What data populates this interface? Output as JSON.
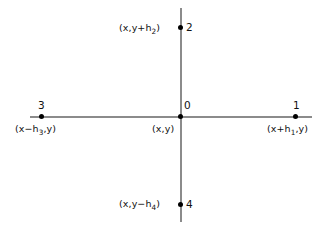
{
  "diagram": {
    "background_color": "#ffffff",
    "axis_color": "#8b8b8b",
    "node_color": "#000000",
    "text_color": "#111111",
    "nodes": [
      {
        "id": "0",
        "number": "0",
        "coordinate_plain": "(x,y)",
        "coord_prefix": "(x,y",
        "coord_sub": "",
        "coord_suffix": ")",
        "position": "center"
      },
      {
        "id": "1",
        "number": "1",
        "coordinate_plain": "(x+h1,y)",
        "coord_prefix": "(x+h",
        "coord_sub": "1",
        "coord_suffix": ",y)",
        "position": "right"
      },
      {
        "id": "2",
        "number": "2",
        "coordinate_plain": "(x,y+h2)",
        "coord_prefix": "(x,y+h",
        "coord_sub": "2",
        "coord_suffix": ")",
        "position": "top"
      },
      {
        "id": "3",
        "number": "3",
        "coordinate_plain": "(x−h3,y)",
        "coord_prefix": "(x−h",
        "coord_sub": "3",
        "coord_suffix": ",y)",
        "position": "left"
      },
      {
        "id": "4",
        "number": "4",
        "coordinate_plain": "(x,y−h4)",
        "coord_prefix": "(x,y−h",
        "coord_sub": "4",
        "coord_suffix": ")",
        "position": "bottom"
      }
    ]
  }
}
